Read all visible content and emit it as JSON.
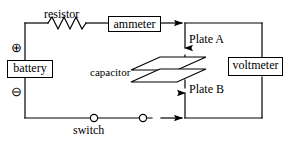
{
  "figure": {
    "type": "circuit-diagram",
    "background_color": "#ffffff",
    "line_color": "#000000"
  },
  "components": {
    "resistor": {
      "label": "resistor",
      "symbol": "zigzag"
    },
    "ammeter": {
      "label": "ammeter",
      "symbol": "boxed-meter"
    },
    "battery": {
      "label": "battery",
      "symbol": "boxed-source",
      "positive_terminal": "⊕",
      "negative_terminal": "⊖"
    },
    "voltmeter": {
      "label": "voltmeter",
      "symbol": "boxed-meter"
    },
    "capacitor": {
      "label": "capacitor",
      "symbol": "parallel-plates",
      "plate_top": "Plate A",
      "plate_bottom": "Plate B"
    },
    "switch": {
      "label": "switch",
      "symbol": "two-open-contacts"
    }
  },
  "annotations": {
    "current_arrows": [
      "top-rail-right",
      "branch-down-to-plate-a",
      "branch-up-to-plate-b",
      "bottom-rail-right"
    ]
  }
}
